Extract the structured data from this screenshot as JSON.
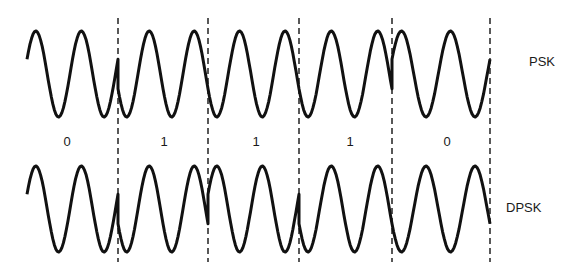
{
  "diagram": {
    "type": "modulation-waveforms",
    "bit_sequence": [
      "0",
      "1",
      "1",
      "1",
      "0"
    ],
    "waveforms": [
      {
        "label": "PSK",
        "phases": [
          0,
          180,
          180,
          180,
          0
        ]
      },
      {
        "label": "DPSK",
        "phases": [
          0,
          180,
          0,
          180,
          180
        ]
      }
    ],
    "bit_boundaries_x": [
      118,
      208,
      299,
      392,
      490
    ],
    "start_x": 27,
    "cycles_per_bit": 2,
    "colors": {
      "stroke": "#111111",
      "dashed": "#222222",
      "background": "#ffffff"
    }
  },
  "labels": {
    "psk": "PSK",
    "dpsk": "DPSK",
    "bits": [
      "0",
      "1",
      "1",
      "1",
      "0"
    ]
  }
}
